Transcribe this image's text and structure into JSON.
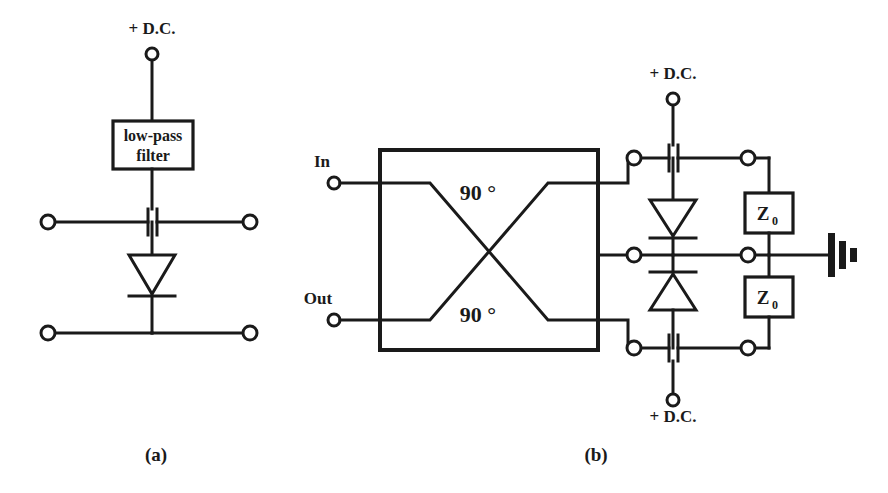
{
  "figure": {
    "background_color": "#ffffff",
    "line_color": "#1a1a1a",
    "width": 888,
    "height": 493
  },
  "panels": [
    {
      "id": "a",
      "caption": "(a)",
      "caption_x": 156,
      "caption_y": 461,
      "description": "single-diode shunt switch with low-pass filter DC bias feed"
    },
    {
      "id": "b",
      "caption": "(b)",
      "caption_x": 596,
      "caption_y": 461,
      "description": "90 degree hybrid coupler reflection switch with two diodes and Z0 terminations"
    }
  ],
  "panel_a": {
    "dc_label": {
      "text": "+ D.C.",
      "x": 152,
      "y": 34
    },
    "dc_terminal": {
      "cx": 152,
      "cy": 54,
      "r": 6
    },
    "filter_box": {
      "x": 113,
      "y": 121,
      "width": 80,
      "height": 48,
      "line1": "low-pass",
      "line2": "filter"
    },
    "signal_line_y": 222,
    "ground_line_y": 333,
    "left_terminal_in": {
      "cx": 48,
      "cy": 222,
      "r": 7
    },
    "right_terminal_in": {
      "cx": 250,
      "cy": 222,
      "r": 7
    },
    "left_terminal_out": {
      "cx": 48,
      "cy": 333,
      "r": 7
    },
    "right_terminal_out": {
      "cx": 250,
      "cy": 333,
      "r": 7
    },
    "capacitor": {
      "cx": 152,
      "cy": 222,
      "plate_gap": 8,
      "plate_half_height": 13
    },
    "diode": {
      "cx": 152,
      "apex_y": 294,
      "base_y": 255,
      "half_width": 23,
      "bar_y": 296,
      "orientation": "cathode-down"
    },
    "center_x": 152
  },
  "panel_b": {
    "port_in": {
      "label": "In",
      "label_x": 322,
      "label_y": 167,
      "cx": 334,
      "cy": 183,
      "r": 6
    },
    "port_out": {
      "label": "Out",
      "label_x": 318,
      "label_y": 304,
      "cx": 334,
      "cy": 320,
      "r": 6
    },
    "coupler": {
      "x": 380,
      "y": 150,
      "width": 218,
      "height": 200,
      "top_label": "90 °",
      "bottom_label": "90 °",
      "top_label_x": 478,
      "top_label_y": 196,
      "bottom_label_x": 478,
      "bottom_label_y": 318,
      "port_top_y": 183,
      "port_bottom_y": 320,
      "stub_len": 48
    },
    "dc_top": {
      "text": "+ D.C.",
      "x": 673,
      "y": 79,
      "terminal_cx": 673,
      "terminal_cy": 99,
      "r": 6
    },
    "dc_bottom": {
      "text": "+ D.C.",
      "x": 673,
      "y": 422,
      "terminal_cx": 673,
      "terminal_cy": 400,
      "r": 6
    },
    "top_rail_y": 158,
    "mid_rail_y": 255,
    "bottom_rail_y": 348,
    "left_node_x": 634,
    "right_node_x": 748,
    "center_x": 673,
    "terminals": [
      {
        "name": "top-left-node",
        "cx": 634,
        "cy": 158,
        "r": 7
      },
      {
        "name": "top-right-node",
        "cx": 748,
        "cy": 158,
        "r": 7
      },
      {
        "name": "mid-left-node",
        "cx": 634,
        "cy": 255,
        "r": 7
      },
      {
        "name": "mid-right-node",
        "cx": 748,
        "cy": 255,
        "r": 7
      },
      {
        "name": "bottom-left-node",
        "cx": 634,
        "cy": 348,
        "r": 7
      },
      {
        "name": "bottom-right-node",
        "cx": 748,
        "cy": 348,
        "r": 7
      }
    ],
    "capacitor_top": {
      "cx": 673,
      "cy": 158,
      "plate_gap": 8,
      "plate_half_height": 13
    },
    "capacitor_bottom": {
      "cx": 673,
      "cy": 348,
      "plate_gap": 8,
      "plate_half_height": 13
    },
    "diode_top": {
      "cx": 673,
      "base_y": 200,
      "apex_y": 236,
      "half_width": 23,
      "bar_y": 238,
      "orientation": "cathode-down"
    },
    "diode_bottom": {
      "cx": 673,
      "base_y": 310,
      "apex_y": 274,
      "half_width": 23,
      "bar_y": 272,
      "orientation": "cathode-up"
    },
    "z_box_top": {
      "x": 745,
      "y": 193,
      "width": 48,
      "height": 40,
      "label": "Z",
      "sub": "0"
    },
    "z_box_bottom": {
      "x": 745,
      "y": 277,
      "width": 48,
      "height": 40,
      "label": "Z",
      "sub": "0"
    },
    "ground": {
      "x": 830,
      "y": 255,
      "bar1_half": 21,
      "bar2_half": 13,
      "bar3_half": 6,
      "spacing": 9,
      "bar_width": 5
    },
    "ground_wire_end_x": 830
  }
}
